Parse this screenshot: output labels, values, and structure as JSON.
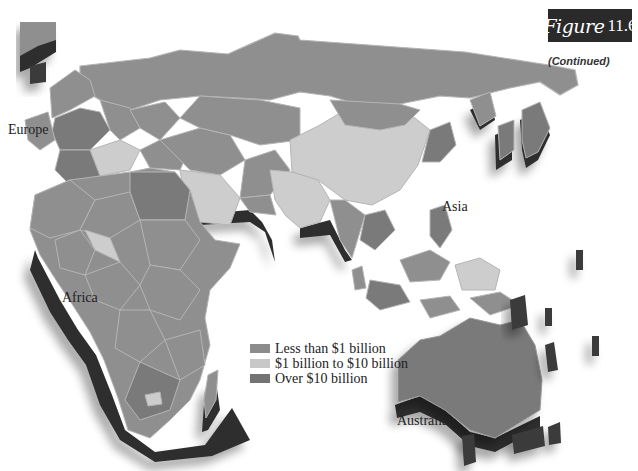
{
  "figure": {
    "word": "Figure",
    "number": "11.6",
    "continued": "(Continued)"
  },
  "labels": {
    "europe": "Europe",
    "asia": "Asia",
    "africa": "Africa",
    "australia": "Australia"
  },
  "legend": {
    "items": [
      {
        "label": "Less than $1 billion",
        "color": "#8c8c8c"
      },
      {
        "label": "$1 billion to $10 billion",
        "color": "#c8c8c8"
      },
      {
        "label": "Over $10 billion",
        "color": "#737373"
      }
    ]
  },
  "colors": {
    "low": "#8f8f8f",
    "mid": "#cdcdcd",
    "high": "#7a7a7a",
    "extrusion": "#2e2e2e",
    "border": "#b5b5b5"
  }
}
